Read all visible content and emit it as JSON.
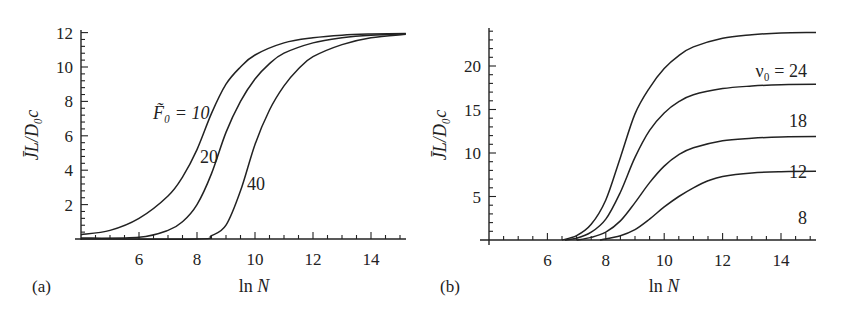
{
  "chart_data": [
    {
      "panel": "(a)",
      "type": "line",
      "title": "",
      "xlabel": "ln N",
      "ylabel": "J̄L/D₀c",
      "xlim": [
        4.0,
        15.2
      ],
      "ylim": [
        0,
        12.2
      ],
      "xticks": [
        6,
        8,
        10,
        12,
        14
      ],
      "yticks": [
        2,
        4,
        6,
        8,
        10,
        12
      ],
      "x_minor_step": 0.5,
      "y_minor_step": 0.4,
      "grid": false,
      "legend": "inline curve labels",
      "series": [
        {
          "name": "F̃₀ = 10",
          "label": "F̃₀ = 10",
          "x": [
            4.0,
            5.0,
            6.0,
            7.0,
            7.5,
            8.0,
            8.5,
            9.0,
            9.5,
            10.0,
            11.0,
            12.0,
            13.0,
            14.0,
            15.2
          ],
          "y": [
            0.25,
            0.5,
            1.2,
            2.5,
            3.6,
            5.2,
            7.3,
            9.0,
            10.0,
            10.7,
            11.4,
            11.7,
            11.85,
            11.92,
            11.95
          ]
        },
        {
          "name": "F̃₀ = 20",
          "label": "20",
          "x": [
            4.0,
            6.0,
            7.0,
            7.5,
            8.0,
            8.5,
            9.0,
            9.5,
            10.0,
            10.5,
            11.0,
            12.0,
            13.0,
            14.0,
            15.2
          ],
          "y": [
            0.05,
            0.1,
            0.5,
            1.0,
            2.0,
            3.8,
            6.2,
            8.0,
            9.3,
            10.2,
            10.8,
            11.4,
            11.7,
            11.85,
            11.93
          ]
        },
        {
          "name": "F̃₀ = 40",
          "label": "40",
          "x": [
            4.0,
            8.0,
            8.5,
            9.0,
            9.5,
            10.0,
            10.5,
            11.0,
            11.5,
            12.0,
            13.0,
            14.0,
            15.2
          ],
          "y": [
            0.0,
            0.0,
            0.2,
            0.8,
            2.8,
            5.5,
            7.5,
            8.9,
            9.9,
            10.6,
            11.3,
            11.7,
            11.9
          ]
        }
      ]
    },
    {
      "panel": "(b)",
      "type": "line",
      "title": "",
      "xlabel": "ln N",
      "ylabel": "J̄L/D₀c",
      "xlim": [
        4.0,
        15.2
      ],
      "ylim": [
        0,
        24.5
      ],
      "xticks": [
        6,
        8,
        10,
        12,
        14
      ],
      "yticks": [
        5,
        10,
        15,
        20
      ],
      "x_minor_step": 0.5,
      "y_minor_step": 1,
      "grid": false,
      "legend": "inline curve labels",
      "series": [
        {
          "name": "ν₀ = 24",
          "label": "ν₀ = 24",
          "x": [
            6.5,
            7.0,
            7.5,
            8.0,
            8.5,
            9.0,
            9.5,
            10.0,
            10.5,
            11.0,
            12.0,
            13.0,
            14.0,
            15.2
          ],
          "y": [
            0.0,
            0.5,
            1.8,
            4.6,
            9.5,
            14.5,
            17.5,
            19.7,
            21.2,
            22.2,
            23.2,
            23.6,
            23.8,
            23.85
          ]
        },
        {
          "name": "ν₀ = 18",
          "label": "18",
          "x": [
            6.6,
            7.0,
            7.5,
            8.0,
            8.5,
            9.0,
            9.5,
            10.0,
            10.5,
            11.0,
            12.0,
            13.0,
            14.0,
            15.2
          ],
          "y": [
            0.0,
            0.2,
            0.9,
            2.4,
            5.5,
            9.5,
            12.6,
            14.6,
            15.9,
            16.7,
            17.4,
            17.7,
            17.85,
            17.9
          ]
        },
        {
          "name": "ν₀ = 12",
          "label": "12",
          "x": [
            7.0,
            7.5,
            8.0,
            8.5,
            9.0,
            9.5,
            10.0,
            10.5,
            11.0,
            12.0,
            13.0,
            14.0,
            15.2
          ],
          "y": [
            0.0,
            0.3,
            0.9,
            2.2,
            4.3,
            6.6,
            8.5,
            9.8,
            10.6,
            11.4,
            11.7,
            11.85,
            11.9
          ]
        },
        {
          "name": "ν₀ = 8",
          "label": "8",
          "x": [
            7.8,
            8.5,
            9.0,
            9.5,
            10.0,
            10.5,
            11.0,
            11.5,
            12.0,
            13.0,
            14.0,
            15.2
          ],
          "y": [
            0.0,
            0.5,
            1.2,
            2.4,
            3.8,
            5.0,
            6.0,
            6.8,
            7.3,
            7.7,
            7.85,
            7.9
          ]
        }
      ]
    }
  ],
  "figure": {
    "panel_a": {
      "panel_label": "(a)",
      "xlabel_text": "ln",
      "xlabel_var": "N",
      "ylabel_text": "J̄L/D₀c",
      "curve_labels": [
        "F̃₀ = 10",
        "20",
        "40"
      ]
    },
    "panel_b": {
      "panel_label": "(b)",
      "xlabel_text": "ln",
      "xlabel_var": "N",
      "ylabel_text": "J̄L/D₀c",
      "curve_labels": [
        "ν₀ = 24",
        "18",
        "12",
        "8"
      ]
    }
  },
  "colors": {
    "ink": "#222222",
    "background": "#ffffff"
  }
}
